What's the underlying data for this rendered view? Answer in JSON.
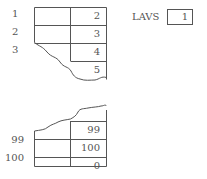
{
  "top_table": {
    "left_labels": [
      "1",
      "2",
      "3"
    ],
    "right_values": [
      "2",
      "3",
      "4",
      "5"
    ]
  },
  "bottom_table": {
    "left_labels": [
      "99",
      "100"
    ],
    "right_values": [
      "99",
      "100",
      "0"
    ]
  },
  "lavs": {
    "label": "LAVS",
    "value": "1"
  }
}
